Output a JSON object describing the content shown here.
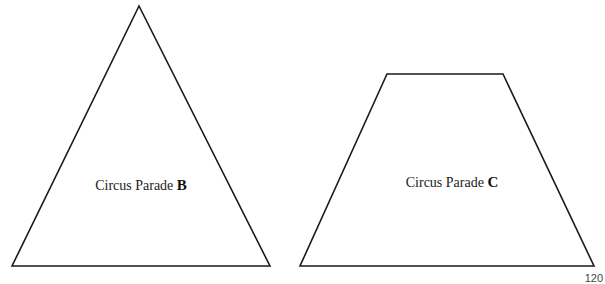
{
  "figures": [
    {
      "id": "B",
      "shape": "triangle",
      "label_text": "Circus Parade ",
      "label_letter": "B",
      "points": "139,6 12,266 270,266",
      "label_position": {
        "x": 141,
        "y": 185
      }
    },
    {
      "id": "C",
      "shape": "trapezoid",
      "label_text": "Circus Parade ",
      "label_letter": "C",
      "points": "387,74 503,74 594,266 300,266",
      "label_position": {
        "x": 452,
        "y": 182
      }
    }
  ],
  "style": {
    "stroke_color": "#1a1a1a",
    "stroke_width": "1.6",
    "fill_color": "#ffffff"
  },
  "page_number": "120"
}
